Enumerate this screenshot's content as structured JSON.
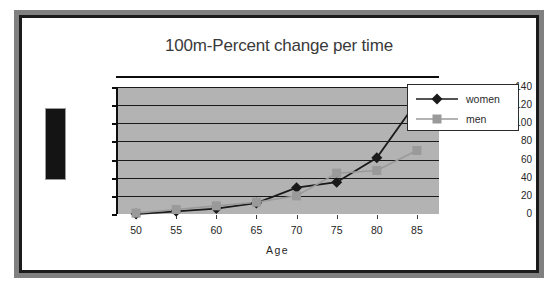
{
  "chart_data": {
    "type": "line",
    "title": "100m-Percent change per time",
    "xlabel": "Age",
    "ylabel": "",
    "categories": [
      50,
      55,
      60,
      65,
      70,
      75,
      80,
      85
    ],
    "tick_labels_x": [
      "50",
      "55",
      "60",
      "65",
      "70",
      "75",
      "80",
      "85"
    ],
    "tick_labels_y": [
      "0",
      "20",
      "40",
      "60",
      "80",
      "100",
      "120",
      "140"
    ],
    "ylim": [
      0,
      140
    ],
    "ytick_step": 20,
    "grid": "horizontal",
    "legend_position": "right",
    "plot_background": "#b3b3b3",
    "series": [
      {
        "name": "women",
        "color": "#1a1a1a",
        "marker": "diamond",
        "values": [
          0,
          3,
          6,
          12,
          29,
          35,
          62,
          124
        ]
      },
      {
        "name": "men",
        "color": "#9a9a9a",
        "marker": "square",
        "values": [
          1,
          5,
          9,
          13,
          20,
          45,
          48,
          70
        ]
      }
    ]
  },
  "slide": {
    "redacted_label": ""
  },
  "legend": {
    "entries": [
      {
        "label": "women"
      },
      {
        "label": "men"
      }
    ]
  },
  "colors": {
    "frame_outer": "#808080",
    "frame_inner": "#1b1b1b",
    "plot_bg": "#b3b3b3",
    "women": "#1a1a1a",
    "men": "#9a9a9a",
    "axis": "#0d0d0d",
    "text": "#262626"
  }
}
